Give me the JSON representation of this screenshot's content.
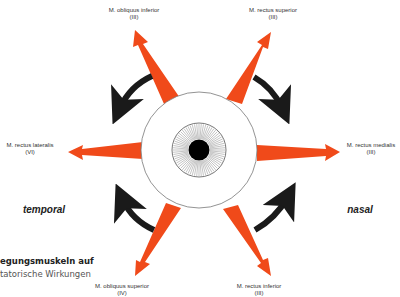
{
  "diagram": {
    "colors": {
      "muscle_arrow": "#f04a1a",
      "rotation_arrow": "#1a1a1a",
      "eye_outline": "#777777",
      "pupil": "#000000"
    },
    "eye": {
      "cx": 199,
      "cy": 150,
      "sclera_r": 58,
      "iris_r": 27,
      "pupil_r": 10
    },
    "muscles": [
      {
        "name": "M. obliquus inferior",
        "nerve": "(III)"
      },
      {
        "name": "M. rectus superior",
        "nerve": "(III)"
      },
      {
        "name": "M. rectus lateralis",
        "nerve": "(VI)"
      },
      {
        "name": "M. rectus medialis",
        "nerve": "(III)"
      },
      {
        "name": "M. obliquus superior",
        "nerve": "(IV)"
      },
      {
        "name": "M. rectus inferior",
        "nerve": "(III)"
      }
    ],
    "sides": {
      "left": "temporal",
      "right": "nasal"
    },
    "caption": {
      "line1": "egungsmuskeln   auf",
      "line2": "tatorische Wirkungen"
    }
  }
}
